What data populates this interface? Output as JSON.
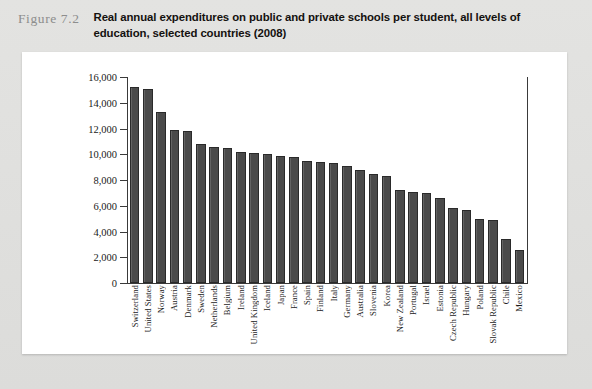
{
  "figure": {
    "label": "Figure 7.2",
    "title": "Real annual expenditures on public and private schools per student, all levels of education, selected countries (2008)"
  },
  "chart_data": {
    "type": "bar",
    "title": "Real annual expenditures on public and private schools per student, all levels of education, selected countries (2008)",
    "xlabel": "",
    "ylabel": "",
    "ylim": [
      0,
      16000
    ],
    "ytick_labels": [
      "16,000",
      "14,000",
      "12,000",
      "10,000",
      "8,000",
      "6,000",
      "4,000",
      "2,000",
      "0"
    ],
    "ytick_values": [
      16000,
      14000,
      12000,
      10000,
      8000,
      6000,
      4000,
      2000,
      0
    ],
    "grid": false,
    "legend": false,
    "bar_color": "#4a4a4a",
    "categories": [
      "Switzerland",
      "United States",
      "Norway",
      "Austria",
      "Denmark",
      "Sweden",
      "Netherlands",
      "Belgium",
      "Ireland",
      "United Kingdom",
      "Iceland",
      "Japan",
      "France",
      "Spain",
      "Finland",
      "Italy",
      "Germany",
      "Australia",
      "Slovenia",
      "Korea",
      "New Zealand",
      "Portugal",
      "Israel",
      "Estonia",
      "Czech Republic",
      "Hungary",
      "Poland",
      "Slovak Republic",
      "Chile",
      "Mexico"
    ],
    "values": [
      15200,
      15100,
      13300,
      11900,
      11800,
      10800,
      10600,
      10500,
      10200,
      10100,
      10000,
      9900,
      9800,
      9500,
      9400,
      9300,
      9100,
      8800,
      8500,
      8300,
      7200,
      7100,
      7000,
      6600,
      5800,
      5700,
      5000,
      4900,
      3400,
      2600
    ]
  }
}
